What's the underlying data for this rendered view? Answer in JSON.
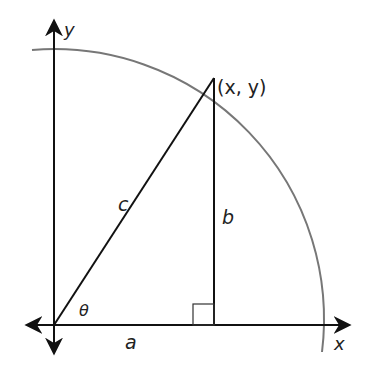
{
  "diagram": {
    "labels": {
      "y_axis": "y",
      "x_axis": "x",
      "point": "(x, y)",
      "hypotenuse": "c",
      "opposite": "b",
      "adjacent": "a",
      "angle": "θ"
    },
    "colors": {
      "axes": "#111111",
      "arc": "#777777",
      "triangle": "#111111",
      "text": "#222222"
    }
  }
}
